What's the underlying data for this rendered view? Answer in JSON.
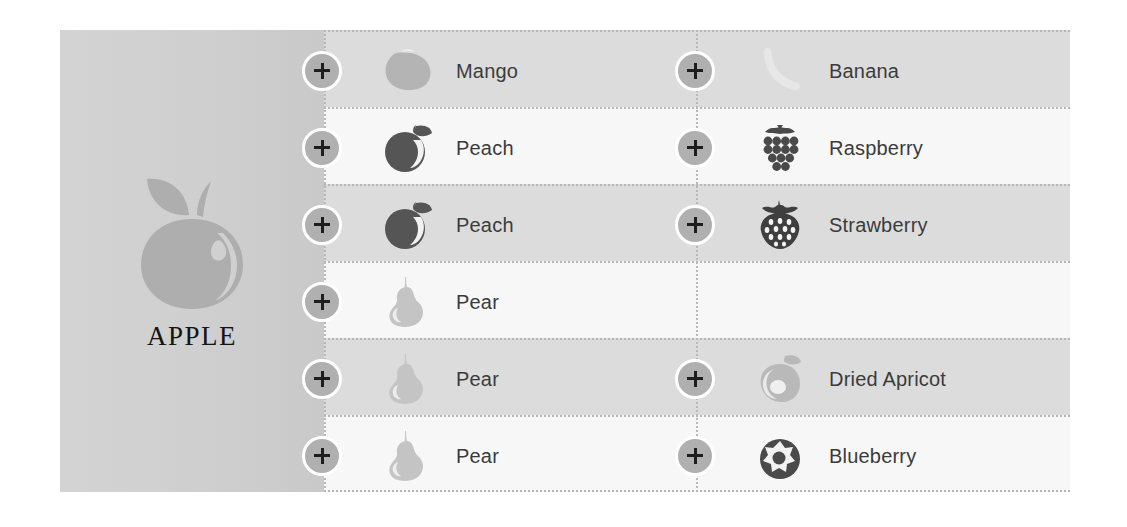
{
  "brand": {
    "title": "APPLE",
    "logo_icon": "apple-icon",
    "logo_color": "#aeaeae"
  },
  "colors": {
    "page_background": "#ffffff",
    "panel_background": "#d0d0d0",
    "row_shade_dark": "#dcdcdc",
    "row_shade_light": "#f7f7f7",
    "separator": "#b6b6b6",
    "plus_button_fill": "#b0b0b0",
    "plus_button_ring": "#ffffff",
    "plus_glyph": "#1d1d1d",
    "label_text": "#3b3b3b",
    "title_text": "#141414"
  },
  "add_button": {
    "label": "+",
    "name": "add-button"
  },
  "rows": [
    {
      "shade": "shade-a",
      "left": {
        "label": "Mango",
        "icon": "mango-icon",
        "icon_color": "#b4b4b4",
        "has_item": true
      },
      "right": {
        "label": "Banana",
        "icon": "banana-icon",
        "icon_color": "#e7e7e7",
        "has_item": true
      }
    },
    {
      "shade": "shade-b",
      "left": {
        "label": "Peach",
        "icon": "peach-icon",
        "icon_color": "#555555",
        "has_item": true
      },
      "right": {
        "label": "Raspberry",
        "icon": "raspberry-icon",
        "icon_color": "#4a4a4a",
        "has_item": true
      }
    },
    {
      "shade": "shade-a",
      "left": {
        "label": "Peach",
        "icon": "peach-icon",
        "icon_color": "#555555",
        "has_item": true
      },
      "right": {
        "label": "Strawberry",
        "icon": "strawberry-icon",
        "icon_color": "#3f3f3f",
        "has_item": true
      }
    },
    {
      "shade": "shade-b",
      "left": {
        "label": "Pear",
        "icon": "pear-icon",
        "icon_color": "#c4c4c4",
        "has_item": true
      },
      "right": {
        "label": "",
        "icon": "",
        "icon_color": "",
        "has_item": false
      }
    },
    {
      "shade": "shade-a",
      "left": {
        "label": "Pear",
        "icon": "pear-icon",
        "icon_color": "#c4c4c4",
        "has_item": true
      },
      "right": {
        "label": "Dried Apricot",
        "icon": "dried-apricot-icon",
        "icon_color": "#b9b9b9",
        "has_item": true
      }
    },
    {
      "shade": "shade-b",
      "left": {
        "label": "Pear",
        "icon": "pear-icon",
        "icon_color": "#c4c4c4",
        "has_item": true
      },
      "right": {
        "label": "Blueberry",
        "icon": "blueberry-icon",
        "icon_color": "#4a4a4a",
        "has_item": true
      }
    }
  ]
}
